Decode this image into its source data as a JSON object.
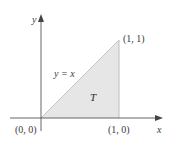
{
  "diagram": {
    "type": "region-diagram",
    "axes": {
      "x_label": "x",
      "y_label": "y"
    },
    "region": {
      "name": "T",
      "fill_color": "#e6e6e6",
      "edge_color": "#c8c8c8",
      "vertices": [
        [
          0,
          0
        ],
        [
          1,
          0
        ],
        [
          1,
          1
        ]
      ]
    },
    "curve_label": "y = x",
    "points": {
      "origin": "(0, 0)",
      "bottom_right": "(1, 0)",
      "top_right": "(1, 1)"
    },
    "colors": {
      "axis": "#555555",
      "text": "#3a3a3a"
    }
  }
}
